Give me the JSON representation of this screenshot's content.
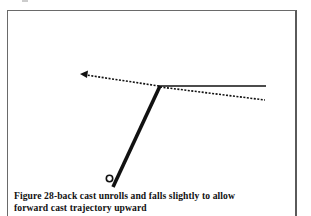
{
  "figure": {
    "caption_line1": "Figure 28-back cast unrolls and falls slightly to allow",
    "caption_line2": "forward cast trajectory upward",
    "caption_full": "Figure 28-back cast unrolls and falls slightly to allow forward cast trajectory upward",
    "elements": {
      "rod": "thick diagonal line from lower-left handle loop up to the junction point",
      "line_backcast": "solid horizontal line extending right from rod tip (back cast unrolled)",
      "line_falling": "dotted line extending right and slightly downward from rod tip (line falls slightly)",
      "forward_trajectory": "dotted arrow from rod tip pointing up-left (forward cast trajectory upward)"
    },
    "colors": {
      "stroke": "#111111",
      "frame": "#6a6a6a",
      "background": "#ffffff"
    }
  }
}
